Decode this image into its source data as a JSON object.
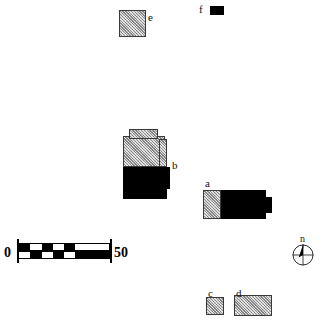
{
  "figure": {
    "type": "archaeological-site-plan",
    "background_color": "#ffffff",
    "fill_hatched_color": "#b4b4b4",
    "fill_solid_color": "#000000",
    "outline_color": "#3a3a3a"
  },
  "features": [
    {
      "id": "a",
      "label": "a",
      "label_x": 205,
      "label_y": 178,
      "x": 203,
      "y": 190,
      "width": 68,
      "height": 29,
      "parts": [
        {
          "name": "hatched-room",
          "fill": "hatched",
          "x": 0,
          "y": 0,
          "w": 18,
          "h": 29
        },
        {
          "name": "solid-block",
          "fill": "solid",
          "x": 18,
          "y": 0,
          "w": 45,
          "h": 29
        },
        {
          "name": "east-annex",
          "fill": "solid",
          "x": 60,
          "y": 7,
          "w": 9,
          "h": 16
        }
      ]
    },
    {
      "id": "b",
      "label": "b",
      "label_x": 172,
      "label_y": 160,
      "x": 123,
      "y": 129,
      "width": 47,
      "height": 74,
      "parts": [
        {
          "name": "hatched-upper-main",
          "fill": "hatched",
          "x": 0,
          "y": 7,
          "w": 42,
          "h": 31
        },
        {
          "name": "hatched-upper-step",
          "fill": "hatched",
          "x": 6,
          "y": 0,
          "w": 29,
          "h": 10
        },
        {
          "name": "hatched-east-wing",
          "fill": "hatched",
          "x": 36,
          "y": 10,
          "w": 8,
          "h": 28
        },
        {
          "name": "solid-lower-main",
          "fill": "solid",
          "x": 0,
          "y": 38,
          "w": 44,
          "h": 32
        },
        {
          "name": "solid-east-annex",
          "fill": "solid",
          "x": 40,
          "y": 38,
          "w": 7,
          "h": 22
        }
      ]
    },
    {
      "id": "c",
      "label": "c",
      "label_x": 208,
      "label_y": 288,
      "x": 206,
      "y": 297,
      "width": 18,
      "height": 18,
      "parts": [
        {
          "name": "hatched-room",
          "fill": "hatched",
          "x": 0,
          "y": 0,
          "w": 18,
          "h": 18
        }
      ]
    },
    {
      "id": "d",
      "label": "d",
      "label_x": 236,
      "label_y": 288,
      "x": 234,
      "y": 295,
      "width": 38,
      "height": 21,
      "parts": [
        {
          "name": "hatched-room",
          "fill": "hatched",
          "x": 0,
          "y": 0,
          "w": 38,
          "h": 21
        }
      ]
    },
    {
      "id": "e",
      "label": "e",
      "label_x": 148,
      "label_y": 12,
      "x": 119,
      "y": 10,
      "width": 27,
      "height": 27,
      "parts": [
        {
          "name": "hatched-room",
          "fill": "hatched",
          "x": 0,
          "y": 0,
          "w": 27,
          "h": 27
        }
      ]
    },
    {
      "id": "f",
      "label": "f",
      "label_x": 199,
      "label_y": 4,
      "x": 210,
      "y": 6,
      "width": 14,
      "height": 9,
      "parts": [
        {
          "name": "solid-block",
          "fill": "solid",
          "x": 0,
          "y": 0,
          "w": 14,
          "h": 9
        }
      ]
    }
  ],
  "scalebar": {
    "name": "scale-bar",
    "start_label": "0",
    "end_label": "50",
    "x": 18,
    "y": 243,
    "width": 92,
    "row_height": 8,
    "segments_top": [
      "on",
      "off",
      "on",
      "off",
      "on",
      "off",
      "off",
      "off"
    ],
    "segments_bottom": [
      "off",
      "on",
      "off",
      "on",
      "off",
      "on",
      "on",
      "on"
    ]
  },
  "compass": {
    "name": "compass-rose",
    "north_label": "n",
    "cx": 303,
    "cy": 255,
    "radius": 10
  }
}
